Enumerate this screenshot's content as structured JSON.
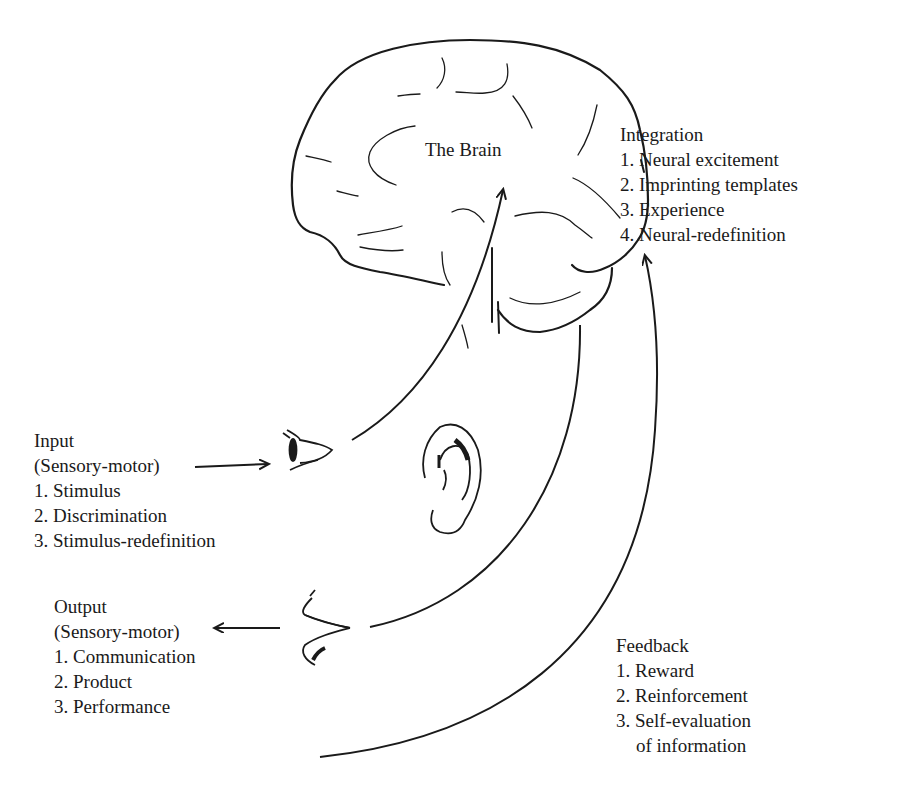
{
  "diagram": {
    "center": {
      "title": "The Brain"
    },
    "integration": {
      "heading": "Integration",
      "items": [
        "1. Neural excitement",
        "2. Imprinting templates",
        "3. Experience",
        "4. Neural-redefinition"
      ]
    },
    "input": {
      "heading": "Input",
      "subheading": "(Sensory-motor)",
      "items": [
        "1. Stimulus",
        "2. Discrimination",
        "3. Stimulus-redefinition"
      ]
    },
    "output": {
      "heading": "Output",
      "subheading": "(Sensory-motor)",
      "items": [
        "1. Communication",
        "2. Product",
        "3. Performance"
      ]
    },
    "feedback": {
      "heading": "Feedback",
      "items": [
        "1. Reward",
        "2. Reinforcement",
        "3. Self-evaluation",
        "of information"
      ]
    },
    "icons": [
      "brain-icon",
      "eye-icon",
      "ear-icon",
      "mouth-icon"
    ],
    "colors": {
      "ink": "#1a1a1a",
      "background": "#ffffff"
    }
  }
}
